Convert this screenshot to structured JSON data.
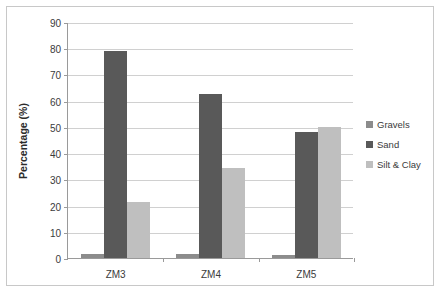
{
  "chart_data": {
    "type": "bar",
    "title": "",
    "xlabel": "",
    "ylabel": "Percentage (%)",
    "ylim": [
      0,
      90
    ],
    "ytick_step": 10,
    "yticks": [
      0,
      10,
      20,
      30,
      40,
      50,
      60,
      70,
      80,
      90
    ],
    "grid": true,
    "legend_position": "right",
    "categories": [
      "ZM3",
      "ZM4",
      "ZM5"
    ],
    "series": [
      {
        "name": "Gravels",
        "color": "#8c8c8c",
        "values": [
          1.7,
          1.6,
          1.3
        ]
      },
      {
        "name": "Sand",
        "color": "#595959",
        "values": [
          79.0,
          62.5,
          48.0
        ]
      },
      {
        "name": "Silt & Clay",
        "color": "#bfbfbf",
        "values": [
          21.5,
          34.5,
          50.0
        ]
      }
    ]
  },
  "colors": {
    "frame_border": "#c8c8c8",
    "axis_line": "#9a9a9a",
    "gridline": "#d0d0d0",
    "text": "#3b3b3b",
    "gravels": "#8c8c8c",
    "sand": "#595959",
    "silt_clay": "#bfbfbf"
  }
}
